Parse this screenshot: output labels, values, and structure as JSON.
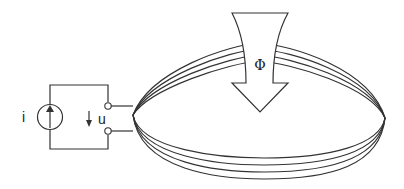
{
  "diagram": {
    "type": "electromagnetic-induction-coil",
    "labels": {
      "current": "i",
      "voltage": "u",
      "flux": "Φ"
    },
    "components": {
      "current_source": {
        "symbol": "circle-with-up-arrow",
        "label_ref": "current"
      },
      "terminals": {
        "count": 2,
        "style": "open-circle"
      },
      "voltage_arrow": {
        "direction": "down",
        "label_ref": "voltage"
      },
      "coil": {
        "turns": 4,
        "shape": "ellipse"
      },
      "flux_arrow": {
        "direction": "down",
        "style": "hollow-block-arrow",
        "label_ref": "flux"
      }
    },
    "colors": {
      "stroke": "#333333",
      "background": "#ffffff"
    }
  }
}
